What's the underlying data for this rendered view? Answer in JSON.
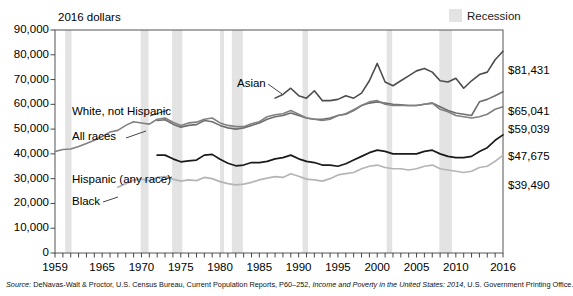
{
  "units_caption": "2016 dollars",
  "legend": {
    "recession_label": "Recession",
    "recession_color": "#e3e3e3"
  },
  "source_note": {
    "prefix": "Source:",
    "body_1": "DeNavas-Walt & Proctor, U.S. Census Bureau, Current Population Reports, P60–252,",
    "italic_title": "Income and Poverty in the United States: 2014",
    "body_2": ", U.S. Government Printing Office."
  },
  "end_values": [
    {
      "label": "$81,431",
      "series": "Asian"
    },
    {
      "label": "$65,041",
      "series": "White, not Hispanic"
    },
    {
      "label": "$59,039",
      "series": "All races"
    },
    {
      "label": "$47,675",
      "series": "Hispanic (any race)"
    },
    {
      "label": "$39,490",
      "series": "Black"
    }
  ],
  "chart_data": {
    "type": "line",
    "title": "",
    "subtitle": "",
    "xlabel": "",
    "ylabel": "2016 dollars",
    "xlim": [
      1959,
      2016
    ],
    "ylim": [
      0,
      90000
    ],
    "grid": false,
    "legend_position": "inline-annotations",
    "ytick_labels": [
      "0",
      "10,000",
      "20,000",
      "30,000",
      "40,000",
      "50,000",
      "60,000",
      "70,000",
      "80,000",
      "90,000"
    ],
    "yticks": [
      0,
      10000,
      20000,
      30000,
      40000,
      50000,
      60000,
      70000,
      80000,
      90000
    ],
    "xtick_labels": [
      "1959",
      "1965",
      "1970",
      "1975",
      "1980",
      "1985",
      "1990",
      "1995",
      "2000",
      "2005",
      "2010",
      "2016"
    ],
    "xticks": [
      1959,
      1965,
      1970,
      1975,
      1980,
      1985,
      1990,
      1995,
      2000,
      2005,
      2010,
      2016
    ],
    "minor_xticks_every": 1,
    "recessions": [
      [
        1960.3,
        1961.1
      ],
      [
        1969.9,
        1970.9
      ],
      [
        1973.9,
        1975.2
      ],
      [
        1980.0,
        1980.5
      ],
      [
        1981.5,
        1982.9
      ],
      [
        1990.5,
        1991.2
      ],
      [
        2001.2,
        2001.9
      ],
      [
        2007.9,
        2009.5
      ]
    ],
    "series": [
      {
        "name": "Asian",
        "color": "#4d4d4d",
        "width": 1.6,
        "x": [
          1987,
          1988,
          1989,
          1990,
          1991,
          1992,
          1993,
          1994,
          1995,
          1996,
          1997,
          1998,
          1999,
          2000,
          2001,
          2002,
          2003,
          2004,
          2005,
          2006,
          2007,
          2008,
          2009,
          2010,
          2011,
          2012,
          2013,
          2014,
          2015,
          2016
        ],
        "y": [
          62500,
          64000,
          66500,
          63500,
          62500,
          65500,
          61500,
          61500,
          62000,
          63500,
          62500,
          64500,
          69500,
          76500,
          69000,
          67500,
          69500,
          71500,
          73500,
          74500,
          73000,
          69500,
          69000,
          70500,
          66500,
          69500,
          72000,
          73000,
          78000,
          81431
        ]
      },
      {
        "name": "White, not Hispanic",
        "color": "#6e6e6e",
        "width": 1.6,
        "x": [
          1972,
          1973,
          1974,
          1975,
          1976,
          1977,
          1978,
          1979,
          1980,
          1981,
          1982,
          1983,
          1984,
          1985,
          1986,
          1987,
          1988,
          1989,
          1990,
          1991,
          1992,
          1993,
          1994,
          1995,
          1996,
          1997,
          1998,
          1999,
          2000,
          2001,
          2002,
          2003,
          2004,
          2005,
          2006,
          2007,
          2008,
          2009,
          2010,
          2011,
          2012,
          2013,
          2014,
          2015,
          2016
        ],
        "y": [
          53500,
          53800,
          52000,
          50800,
          51500,
          51800,
          53500,
          53000,
          51500,
          50500,
          50000,
          50500,
          51500,
          52500,
          54000,
          55000,
          55500,
          56500,
          55500,
          54500,
          54000,
          54000,
          54500,
          55500,
          56000,
          57500,
          59500,
          60500,
          61000,
          60500,
          60000,
          59800,
          59500,
          59500,
          60000,
          60500,
          59000,
          57500,
          56500,
          56000,
          55500,
          61000,
          62000,
          63500,
          65041
        ]
      },
      {
        "name": "All races",
        "color": "#808080",
        "width": 1.6,
        "x": [
          1959,
          1960,
          1961,
          1962,
          1963,
          1964,
          1965,
          1966,
          1967,
          1968,
          1969,
          1970,
          1971,
          1972,
          1973,
          1974,
          1975,
          1976,
          1977,
          1978,
          1979,
          1980,
          1981,
          1982,
          1983,
          1984,
          1985,
          1986,
          1987,
          1988,
          1989,
          1990,
          1991,
          1992,
          1993,
          1994,
          1995,
          1996,
          1997,
          1998,
          1999,
          2000,
          2001,
          2002,
          2003,
          2004,
          2005,
          2006,
          2007,
          2008,
          2009,
          2010,
          2011,
          2012,
          2013,
          2014,
          2015,
          2016
        ],
        "y": [
          41000,
          41800,
          42000,
          43000,
          44200,
          45500,
          47000,
          48800,
          49500,
          51500,
          53000,
          52500,
          52000,
          54000,
          54500,
          52800,
          51500,
          52500,
          52800,
          54000,
          54500,
          52500,
          51500,
          51000,
          51000,
          52200,
          53000,
          55000,
          55800,
          56200,
          57500,
          56000,
          54500,
          54000,
          53500,
          54000,
          55500,
          56200,
          57800,
          59500,
          61000,
          61500,
          60000,
          59500,
          59500,
          59500,
          59500,
          60000,
          60500,
          58000,
          57000,
          55500,
          55000,
          54500,
          55000,
          56000,
          58000,
          59039
        ]
      },
      {
        "name": "Hispanic (any race)",
        "color": "#1a1a1a",
        "width": 1.7,
        "x": [
          1972,
          1973,
          1974,
          1975,
          1976,
          1977,
          1978,
          1979,
          1980,
          1981,
          1982,
          1983,
          1984,
          1985,
          1986,
          1987,
          1988,
          1989,
          1990,
          1991,
          1992,
          1993,
          1994,
          1995,
          1996,
          1997,
          1998,
          1999,
          2000,
          2001,
          2002,
          2003,
          2004,
          2005,
          2006,
          2007,
          2008,
          2009,
          2010,
          2011,
          2012,
          2013,
          2014,
          2015,
          2016
        ],
        "y": [
          39500,
          39500,
          38000,
          36800,
          37200,
          37500,
          39500,
          39800,
          37800,
          36200,
          35200,
          35500,
          36500,
          36500,
          37000,
          38000,
          38500,
          39500,
          38000,
          37000,
          36500,
          35500,
          35500,
          35000,
          36000,
          37500,
          39000,
          40500,
          41500,
          41000,
          40000,
          40000,
          40000,
          40000,
          41000,
          41500,
          40000,
          39000,
          38500,
          38500,
          39000,
          41000,
          42500,
          45500,
          47675
        ]
      },
      {
        "name": "Black",
        "color": "#b5b5b5",
        "width": 1.7,
        "x": [
          1967,
          1968,
          1969,
          1970,
          1971,
          1972,
          1973,
          1974,
          1975,
          1976,
          1977,
          1978,
          1979,
          1980,
          1981,
          1982,
          1983,
          1984,
          1985,
          1986,
          1987,
          1988,
          1989,
          1990,
          1991,
          1992,
          1993,
          1994,
          1995,
          1996,
          1997,
          1998,
          1999,
          2000,
          2001,
          2002,
          2003,
          2004,
          2005,
          2006,
          2007,
          2008,
          2009,
          2010,
          2011,
          2012,
          2013,
          2014,
          2015,
          2016
        ],
        "y": [
          26500,
          28000,
          29500,
          29800,
          29200,
          30500,
          30800,
          29800,
          29000,
          29500,
          29200,
          30500,
          30000,
          28800,
          28000,
          27500,
          27800,
          28500,
          29500,
          30200,
          30800,
          30500,
          32000,
          31000,
          29800,
          29500,
          29000,
          30000,
          31500,
          32000,
          32500,
          34000,
          35000,
          35500,
          34500,
          34000,
          34000,
          33500,
          34000,
          35000,
          35500,
          34000,
          33500,
          33000,
          32500,
          33000,
          34500,
          35000,
          37000,
          39490
        ]
      }
    ]
  },
  "series_annotations": [
    {
      "name": "Asian",
      "label": "Asian"
    },
    {
      "name": "White, not Hispanic",
      "label": "White, not Hispanic"
    },
    {
      "name": "All races",
      "label": "All races"
    },
    {
      "name": "Hispanic (any race)",
      "label": "Hispanic (any race)"
    },
    {
      "name": "Black",
      "label": "Black"
    }
  ]
}
